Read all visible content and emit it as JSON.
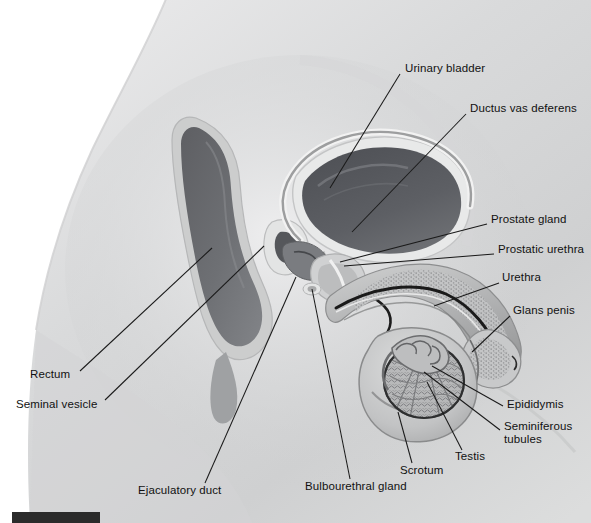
{
  "figure": {
    "type": "anatomical-illustration",
    "width": 591,
    "height": 523,
    "background_color": "#ffffff",
    "marker_bar_color": "#2b2b2b"
  },
  "labels": [
    {
      "id": "urinary-bladder",
      "text": "Urinary bladder",
      "x": 405,
      "y": 68,
      "align": "left"
    },
    {
      "id": "ductus-vas-deferens",
      "text": "Ductus vas deferens",
      "x": 470,
      "y": 108,
      "align": "left"
    },
    {
      "id": "prostate-gland",
      "text": "Prostate gland",
      "x": 491,
      "y": 219,
      "align": "left"
    },
    {
      "id": "prostatic-urethra",
      "text": "Prostatic urethra",
      "x": 498,
      "y": 249,
      "align": "left"
    },
    {
      "id": "urethra",
      "text": "Urethra",
      "x": 502,
      "y": 277,
      "align": "left"
    },
    {
      "id": "glans-penis",
      "text": "Glans penis",
      "x": 513,
      "y": 310,
      "align": "left"
    },
    {
      "id": "epididymis",
      "text": "Epididymis",
      "x": 507,
      "y": 403,
      "align": "left"
    },
    {
      "id": "seminiferous-tubules",
      "text": "Seminiferous\ntubules",
      "x": 504,
      "y": 425,
      "align": "left"
    },
    {
      "id": "testis",
      "text": "Testis",
      "x": 455,
      "y": 455,
      "align": "left"
    },
    {
      "id": "scrotum",
      "text": "Scrotum",
      "x": 400,
      "y": 470,
      "align": "left"
    },
    {
      "id": "bulbourethral-gland",
      "text": "Bulbourethral gland",
      "x": 305,
      "y": 485,
      "align": "left"
    },
    {
      "id": "ejaculatory-duct",
      "text": "Ejaculatory duct",
      "x": 138,
      "y": 489,
      "align": "left"
    },
    {
      "id": "seminal-vesicle",
      "text": "Seminal vesicle",
      "x": 16,
      "y": 403,
      "align": "left"
    },
    {
      "id": "rectum",
      "text": "Rectum",
      "x": 30,
      "y": 374,
      "align": "left"
    }
  ],
  "leader_lines": [
    {
      "id": "leader-urinary-bladder",
      "from": [
        400,
        74
      ],
      "to": [
        330,
        188
      ]
    },
    {
      "id": "leader-ductus-vas-deferens",
      "from": [
        466,
        114
      ],
      "to": [
        352,
        232
      ]
    },
    {
      "id": "leader-prostate-gland",
      "from": [
        487,
        224
      ],
      "to": [
        340,
        262
      ]
    },
    {
      "id": "leader-prostatic-urethra",
      "from": [
        494,
        254
      ],
      "to": [
        344,
        266
      ]
    },
    {
      "id": "leader-urethra",
      "from": [
        499,
        283
      ],
      "to": [
        434,
        306
      ]
    },
    {
      "id": "leader-glans-penis",
      "from": [
        510,
        316
      ],
      "to": [
        472,
        352
      ]
    },
    {
      "id": "leader-epididymis",
      "from": [
        503,
        406
      ],
      "to": [
        432,
        366
      ]
    },
    {
      "id": "leader-seminiferous-tubules",
      "from": [
        500,
        430
      ],
      "to": [
        424,
        372
      ]
    },
    {
      "id": "leader-testis",
      "from": [
        462,
        450
      ],
      "to": [
        427,
        382
      ]
    },
    {
      "id": "leader-scrotum",
      "from": [
        412,
        463
      ],
      "to": [
        398,
        412
      ]
    },
    {
      "id": "leader-bulbourethral-gland",
      "from": [
        350,
        479
      ],
      "to": [
        312,
        289
      ]
    },
    {
      "id": "leader-ejaculatory-duct",
      "from": [
        205,
        483
      ],
      "to": [
        296,
        277
      ]
    },
    {
      "id": "leader-seminal-vesicle",
      "from": [
        105,
        400
      ],
      "to": [
        264,
        246
      ]
    },
    {
      "id": "leader-rectum",
      "from": [
        80,
        371
      ],
      "to": [
        212,
        248
      ]
    }
  ],
  "structures": [
    {
      "id": "body-silhouette",
      "label": "body outline (midsagittal torso / pelvis)"
    },
    {
      "id": "rectum-shape",
      "label": "rectum"
    },
    {
      "id": "bladder-shape",
      "label": "urinary bladder"
    },
    {
      "id": "pubic-bone",
      "label": "pubic symphysis"
    },
    {
      "id": "prostate-shape",
      "label": "prostate gland"
    },
    {
      "id": "penis-shaft",
      "label": "penis (corpus cavernosum / spongiosum)"
    },
    {
      "id": "glans-shape",
      "label": "glans penis"
    },
    {
      "id": "scrotum-shape",
      "label": "scrotum"
    },
    {
      "id": "testis-shape",
      "label": "testis with seminiferous tubules"
    },
    {
      "id": "epididymis-shape",
      "label": "epididymis"
    },
    {
      "id": "vas-deferens-duct",
      "label": "ductus vas deferens"
    }
  ]
}
